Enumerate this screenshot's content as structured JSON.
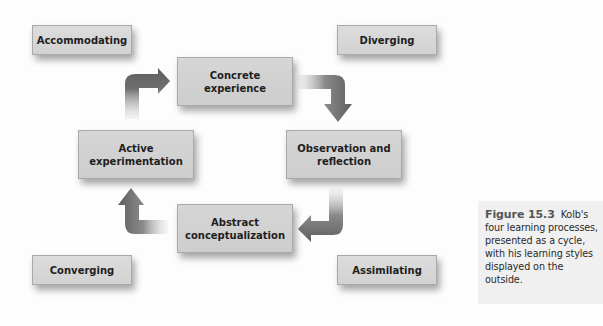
{
  "diagram": {
    "type": "cycle",
    "learning_styles": {
      "top_left": "Accommodating",
      "top_right": "Diverging",
      "bottom_left": "Converging",
      "bottom_right": "Assimilating"
    },
    "processes": {
      "top": {
        "line1": "Concrete",
        "line2": "experience"
      },
      "right": {
        "line1": "Observation and",
        "line2": "reflection"
      },
      "bottom": {
        "line1": "Abstract",
        "line2": "conceptualization"
      },
      "left": {
        "line1": "Active",
        "line2": "experimentation"
      }
    },
    "cycle_order": [
      "Concrete experience",
      "Observation and reflection",
      "Abstract conceptualization",
      "Active experimentation"
    ],
    "arrow_direction": "clockwise",
    "colors": {
      "box_fill": "#d4d4d4",
      "box_border": "#a9a9a9",
      "arrow": "#666666",
      "caption_bg": "#f0f0f0"
    }
  },
  "caption": {
    "label": "Figure 15.3",
    "lines": [
      "four learning processes,",
      "presented as a cycle,",
      "with his learning styles",
      "displayed on the",
      "outside."
    ],
    "first_line_rest": "Kolb's"
  }
}
